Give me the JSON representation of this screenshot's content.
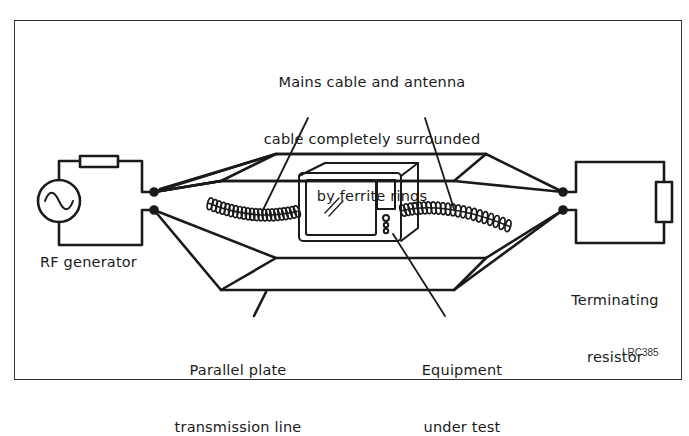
{
  "figure": {
    "id_code": "I RC385",
    "colors": {
      "ink": "#1a1a1a",
      "frame": "#333333",
      "background": "#ffffff"
    }
  },
  "labels": {
    "cables": [
      "Mains cable and antenna",
      "cable completely surrounded",
      "by ferrite rings"
    ],
    "rf_generator": "RF generator",
    "terminating_resistor": [
      "Terminating",
      "resistor"
    ],
    "transmission_line": [
      "Parallel plate",
      "transmission line"
    ],
    "equipment": [
      "Equipment",
      "under test"
    ]
  },
  "components": {
    "source": "ac-source-icon",
    "series_resistor": "resistor-icon",
    "load": "resistor-icon",
    "device": "monitor-icon",
    "cables": "ferrite-coil-icon"
  }
}
